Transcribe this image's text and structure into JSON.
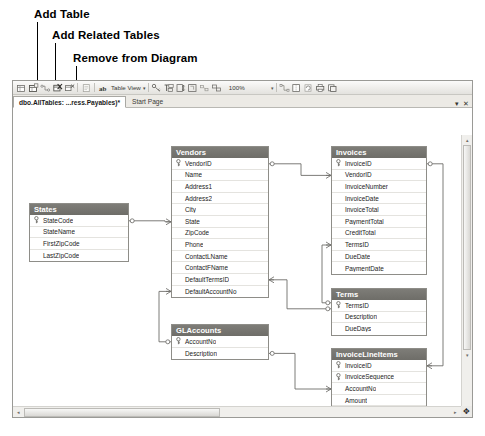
{
  "annotations": [
    {
      "label": "Add Table",
      "label_x": 34,
      "label_y": 8,
      "line_x": 37,
      "line_y": 22,
      "line_h": 63
    },
    {
      "label": "Add Related Tables",
      "label_x": 52,
      "label_y": 29,
      "line_x": 55,
      "line_y": 43,
      "line_h": 42
    },
    {
      "label": "Remove from Diagram",
      "label_x": 73,
      "label_y": 52,
      "line_x": 76,
      "line_y": 66,
      "line_h": 19
    }
  ],
  "toolbar": {
    "buttons": [
      {
        "name": "new-table-icon",
        "title": "New Table"
      },
      {
        "name": "add-table-icon",
        "title": "Add Table"
      },
      {
        "name": "add-related-tables-icon",
        "title": "Add Related Tables"
      },
      {
        "name": "delete-table-icon",
        "title": "Delete Tables from Database"
      },
      {
        "name": "remove-from-diagram-icon",
        "title": "Remove from Diagram"
      },
      {
        "name": "generate-change-script-icon",
        "title": "Generate Change Script"
      }
    ],
    "relationships_icon": "relationships-icon",
    "view_label": "Table View",
    "view_caret": "▾",
    "layout_buttons": [
      {
        "name": "set-primary-key-icon"
      },
      {
        "name": "new-text-annotation-icon"
      },
      {
        "name": "autosize-selected-tables-icon"
      },
      {
        "name": "arrange-selection-icon"
      },
      {
        "name": "arrange-tables-icon"
      },
      {
        "name": "zoom-icon"
      }
    ],
    "zoom_value": "100%",
    "zoom_caret": "▾",
    "right_buttons": [
      {
        "name": "show-relationship-labels-icon"
      },
      {
        "name": "page-breaks-icon"
      },
      {
        "name": "recalculate-page-breaks-icon"
      },
      {
        "name": "print-preview-icon"
      },
      {
        "name": "copy-to-clipboard-icon"
      }
    ]
  },
  "tabs": [
    {
      "label": "dbo.AllTables: ...ress.Payables)*",
      "active": true,
      "name": "tab-diagram"
    },
    {
      "label": "Start Page",
      "active": false,
      "name": "tab-start-page"
    }
  ],
  "tab_controls": {
    "dropdown": "▾",
    "close": "✕"
  },
  "scrollbars": {
    "h_left_arrow": "◂",
    "h_right_arrow": "▸",
    "v_up_arrow": "▴",
    "v_down_arrow": "▾",
    "resize_grip": "✥"
  },
  "entities": [
    {
      "name": "States",
      "x": 16,
      "y": 95,
      "w": 100,
      "fields": [
        {
          "name": "StateCode",
          "key": true
        },
        {
          "name": "StateName",
          "key": false
        },
        {
          "name": "FirstZipCode",
          "key": false
        },
        {
          "name": "LastZipCode",
          "key": false
        }
      ]
    },
    {
      "name": "Vendors",
      "x": 158,
      "y": 38,
      "w": 98,
      "fields": [
        {
          "name": "VendorID",
          "key": true
        },
        {
          "name": "Name",
          "key": false
        },
        {
          "name": "Address1",
          "key": false
        },
        {
          "name": "Address2",
          "key": false
        },
        {
          "name": "City",
          "key": false
        },
        {
          "name": "State",
          "key": false
        },
        {
          "name": "ZipCode",
          "key": false
        },
        {
          "name": "Phone",
          "key": false
        },
        {
          "name": "ContactLName",
          "key": false
        },
        {
          "name": "ContactFName",
          "key": false
        },
        {
          "name": "DefaultTermsID",
          "key": false
        },
        {
          "name": "DefaultAccountNo",
          "key": false
        }
      ]
    },
    {
      "name": "Invoices",
      "x": 318,
      "y": 38,
      "w": 96,
      "fields": [
        {
          "name": "InvoiceID",
          "key": true
        },
        {
          "name": "VendorID",
          "key": false
        },
        {
          "name": "InvoiceNumber",
          "key": false
        },
        {
          "name": "InvoiceDate",
          "key": false
        },
        {
          "name": "InvoiceTotal",
          "key": false
        },
        {
          "name": "PaymentTotal",
          "key": false
        },
        {
          "name": "CreditTotal",
          "key": false
        },
        {
          "name": "TermsID",
          "key": false
        },
        {
          "name": "DueDate",
          "key": false
        },
        {
          "name": "PaymentDate",
          "key": false
        }
      ]
    },
    {
      "name": "Terms",
      "x": 318,
      "y": 180,
      "w": 96,
      "fields": [
        {
          "name": "TermsID",
          "key": true
        },
        {
          "name": "Description",
          "key": false
        },
        {
          "name": "DueDays",
          "key": false
        }
      ]
    },
    {
      "name": "GLAccounts",
      "x": 158,
      "y": 216,
      "w": 98,
      "fields": [
        {
          "name": "AccountNo",
          "key": true
        },
        {
          "name": "Description",
          "key": false
        }
      ]
    },
    {
      "name": "InvoiceLineItems",
      "x": 318,
      "y": 240,
      "w": 96,
      "fields": [
        {
          "name": "InvoiceID",
          "key": true
        },
        {
          "name": "InvoiceSequence",
          "key": true
        },
        {
          "name": "AccountNo",
          "key": false
        },
        {
          "name": "Amount",
          "key": false
        },
        {
          "name": "Description",
          "key": false
        }
      ]
    }
  ],
  "relationships": [
    {
      "from": "States",
      "to": "Vendors",
      "name": "rel-states-vendors"
    },
    {
      "from": "Vendors",
      "to": "Invoices",
      "name": "rel-vendors-invoices"
    },
    {
      "from": "Vendors",
      "to": "GLAccounts",
      "name": "rel-vendors-glaccounts"
    },
    {
      "from": "Vendors",
      "to": "Terms",
      "name": "rel-vendors-terms"
    },
    {
      "from": "Invoices",
      "to": "Terms",
      "name": "rel-invoices-terms"
    },
    {
      "from": "Invoices",
      "to": "InvoiceLineItems",
      "name": "rel-invoices-lineitems"
    },
    {
      "from": "GLAccounts",
      "to": "InvoiceLineItems",
      "name": "rel-glaccounts-lineitems"
    }
  ],
  "colors": {
    "header_bg": "#72716c",
    "header_text": "#ffffff",
    "border": "#8e8d88",
    "canvas": "#ffffff",
    "chrome": "#eceae5",
    "relation_line": "#6e6d69"
  }
}
